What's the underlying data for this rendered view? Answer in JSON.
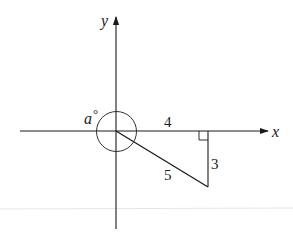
{
  "diagram": {
    "axes": {
      "x_label": "x",
      "y_label": "y"
    },
    "angle": {
      "label_var": "a",
      "label_unit": "°"
    },
    "triangle": {
      "adjacent_label": "4",
      "opposite_label": "3",
      "hypotenuse_label": "5"
    },
    "colors": {
      "stroke": "#1a1a1a",
      "background": "#ffffff"
    }
  }
}
